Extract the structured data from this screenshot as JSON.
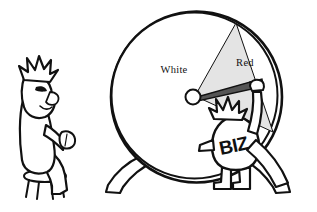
{
  "scene": {
    "title": "Rigged wheel of fortune cartoon",
    "background_color": "#ffffff",
    "ink_color": "#111111",
    "width": 317,
    "height": 212
  },
  "wheel": {
    "name": "wheel-of-fortune",
    "center": {
      "x": 195,
      "y": 96
    },
    "radius": 85,
    "rim_color": "#111111",
    "face_color": "#ffffff",
    "sectors": [
      {
        "label": "White",
        "fill_color": "#ffffff",
        "label_x": 174,
        "label_y": 72,
        "start_angle_deg": 25,
        "end_angle_deg": 300
      },
      {
        "label": "Red",
        "fill_color": "#e2e2e2",
        "label_x": 245,
        "label_y": 66,
        "start_angle_deg": -60,
        "end_angle_deg": 25
      }
    ],
    "needle": {
      "name": "wheel-needle",
      "pivot_color": "#ffffff",
      "blade_color": "#4a4a4a",
      "pointing_at": "Red"
    }
  },
  "characters": [
    {
      "name": "seated-observer",
      "label": "",
      "posture": "seated on stool, raised fist",
      "has_stool": true,
      "hair": "spiky"
    },
    {
      "name": "biz-character",
      "label": "BIZ",
      "posture": "standing, reaching up, pulling the needle",
      "has_stool": false,
      "hair": "spiky"
    }
  ],
  "labels": {
    "white_sector": "White",
    "red_sector": "Red",
    "biz_body": "BIZ"
  }
}
